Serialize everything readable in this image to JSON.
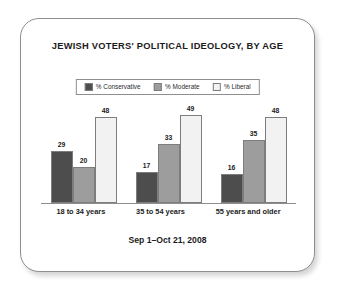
{
  "card": {
    "title": "JEWISH VOTERS' POLITICAL IDEOLOGY, BY AGE",
    "footer_note": "Sep 1–Oct 21, 2008"
  },
  "colors": {
    "conservative": "#4d4d4d",
    "moderate": "#9d9d9d",
    "liberal": "#f2f2f2",
    "border": "#8e8e8e",
    "text": "#1b1b1b",
    "background": "#ffffff"
  },
  "legend": {
    "items": [
      {
        "label": "% Conservative",
        "color": "#4d4d4d",
        "icon": "legend-swatch-icon"
      },
      {
        "label": "% Moderate",
        "color": "#9d9d9d",
        "icon": "legend-swatch-icon"
      },
      {
        "label": "% Liberal",
        "color": "#f2f2f2",
        "icon": "legend-swatch-icon"
      }
    ]
  },
  "chart_data": {
    "type": "bar",
    "title": "JEWISH VOTERS' POLITICAL IDEOLOGY, BY AGE",
    "subtitle": "Sep 1–Oct 21, 2008",
    "xlabel": "",
    "ylabel": "",
    "ylim": [
      0,
      55
    ],
    "grid": false,
    "legend_position": "top-center",
    "value_labels": true,
    "categories": [
      "18 to 34 years",
      "35 to 54 years",
      "55 years and older"
    ],
    "series": [
      {
        "name": "% Conservative",
        "color": "#4d4d4d",
        "values": [
          29,
          17,
          16
        ]
      },
      {
        "name": "% Moderate",
        "color": "#9d9d9d",
        "values": [
          20,
          33,
          35
        ]
      },
      {
        "name": "% Liberal",
        "color": "#f2f2f2",
        "values": [
          48,
          49,
          48
        ]
      }
    ]
  }
}
